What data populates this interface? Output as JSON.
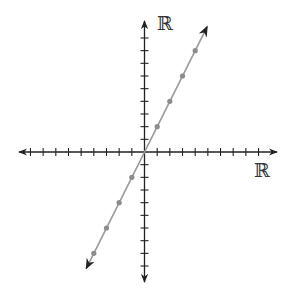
{
  "chart_data": {
    "type": "line",
    "title": "",
    "xlabel": "ℝ",
    "ylabel": "ℝ",
    "xlim": [
      -9,
      9
    ],
    "ylim": [
      -9,
      9
    ],
    "x_ticks_each_side": 9,
    "y_ticks_each_side": 9,
    "tick_labels_shown": false,
    "grid": false,
    "series": [
      {
        "name": "line",
        "equation": "y = 2x",
        "slope": 2,
        "intercept": 0,
        "arrows_both_ends": true,
        "marked_points": [
          {
            "x": -4,
            "y": -8
          },
          {
            "x": -3,
            "y": -6
          },
          {
            "x": -2,
            "y": -4
          },
          {
            "x": -1,
            "y": -2
          },
          {
            "x": 1,
            "y": 2
          },
          {
            "x": 2,
            "y": 4
          },
          {
            "x": 3,
            "y": 6
          },
          {
            "x": 4,
            "y": 8
          }
        ]
      }
    ]
  },
  "labels": {
    "y_axis": "ℝ",
    "x_axis": "ℝ"
  },
  "colors": {
    "axis": "#222222",
    "line": "#9a9a9a",
    "point": "#8c8c8c",
    "background": "#ffffff"
  },
  "layout": {
    "origin_px": [
      144.5,
      152
    ],
    "unit_px": 12.67,
    "x_axis_px": [
      19,
      277
    ],
    "y_axis_px": [
      21,
      282
    ],
    "tick_half_px": 4,
    "line_end_units": [
      [
        -4.6,
        -9.2
      ],
      [
        4.95,
        9.9
      ]
    ]
  }
}
